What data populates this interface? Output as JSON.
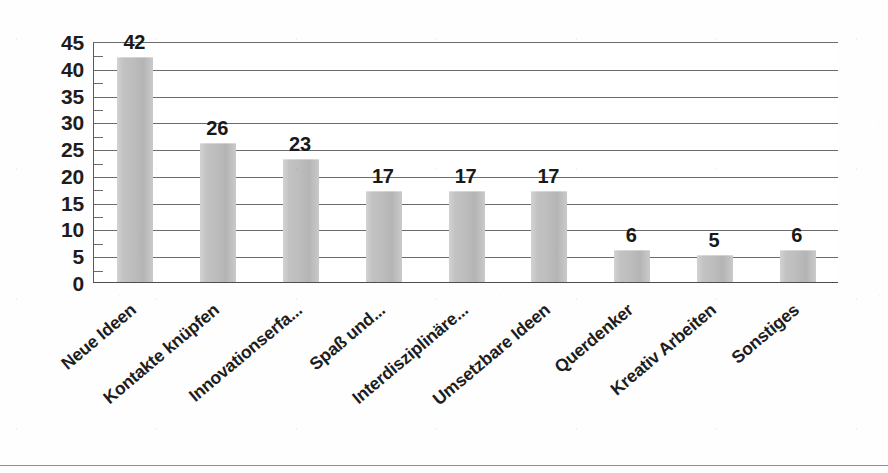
{
  "chart_data": {
    "type": "bar",
    "title": "",
    "subtitle": "",
    "xlabel": "",
    "ylabel": "",
    "categories": [
      "Neue Ideen",
      "Kontakte knüpfen",
      "Innovationserfa...",
      "Spaß und...",
      "Interdisziplinäre...",
      "Umsetzbare Ideen",
      "Querdenker",
      "Kreativ Arbeiten",
      "Sonstiges"
    ],
    "values": [
      42,
      26,
      23,
      17,
      17,
      17,
      6,
      5,
      6
    ],
    "data_labels": [
      "42",
      "26",
      "23",
      "17",
      "17",
      "17",
      "6",
      "5",
      "6"
    ],
    "ylim": [
      0,
      45
    ],
    "ytick_values": [
      45,
      40,
      35,
      30,
      25,
      20,
      15,
      10,
      5,
      0
    ],
    "ytick_labels": [
      "45",
      "40",
      "35",
      "30",
      "25",
      "20",
      "15",
      "10",
      "5",
      "0"
    ],
    "grid": true,
    "grid_orientation": "horizontal",
    "legend": false,
    "legend_position": "none",
    "bar_color": "#c2c2c2",
    "gridline_color": "#6b6b6b",
    "axis_color": "#4e4e4e",
    "text_color": "#1d1d1d",
    "background_color": "#ffffff",
    "label_rotation_degrees": -40
  }
}
